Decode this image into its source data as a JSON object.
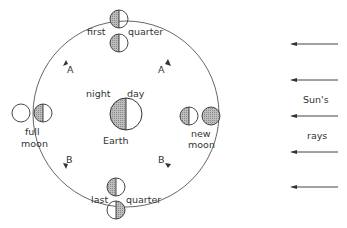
{
  "diagram": {
    "earth": {
      "label": "Earth",
      "night_label": "night",
      "day_label": "day"
    },
    "phases": {
      "first_quarter": {
        "word1": "first",
        "word2": "quarter"
      },
      "last_quarter": {
        "word1": "last",
        "word2": "quarter"
      },
      "full_moon": {
        "line1": "full",
        "line2": "moon"
      },
      "new_moon": {
        "line1": "new",
        "line2": "moon"
      }
    },
    "orbit_markers": {
      "upper_left": "A",
      "upper_right": "A",
      "lower_left": "B",
      "lower_right": "B"
    },
    "sun": {
      "line1": "Sun's",
      "line2": "rays",
      "arrow_count": 5
    },
    "colors": {
      "shade": "#a8a8a8",
      "line": "#444444"
    }
  }
}
